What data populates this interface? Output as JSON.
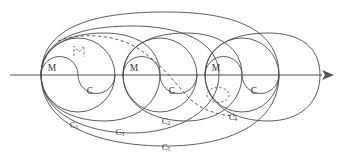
{
  "figure": {
    "background_color": "#ffffff",
    "stroke_color": "#4a4a4a",
    "axis_color": "#555555",
    "label_color": "#333333",
    "width": 338,
    "height": 166
  },
  "axis": {
    "name": "horizontal-axis",
    "x_start": 10,
    "x_end": 326,
    "y": 75,
    "has_arrow": true,
    "arrow_side": "right"
  },
  "cells": [
    {
      "index": 1,
      "center_x": 78,
      "upper_label": "M",
      "lower_label": "C",
      "upper_label_x": 52,
      "upper_label_y": 69,
      "lower_label_x": 90,
      "lower_label_y": 92,
      "radius": 37
    },
    {
      "index": 2,
      "center_x": 160,
      "upper_label": "M",
      "lower_label": "C",
      "upper_label_x": 134,
      "upper_label_y": 69,
      "lower_label_x": 172,
      "lower_label_y": 92,
      "radius": 37
    },
    {
      "index": 3,
      "center_x": 242,
      "upper_label": "M",
      "lower_label": "C",
      "upper_label_x": 216,
      "upper_label_y": 69,
      "lower_label_x": 254,
      "lower_label_y": 92,
      "radius": 37
    }
  ],
  "curve_labels": [
    {
      "name": "curve-label-c1",
      "base": "C",
      "sub": "1",
      "x": 74,
      "y": 126
    },
    {
      "name": "curve-label-c2",
      "base": "C",
      "sub": "2",
      "x": 166,
      "y": 122
    },
    {
      "name": "curve-label-c3",
      "base": "C",
      "sub": "3",
      "x": 120,
      "y": 133
    },
    {
      "name": "curve-label-c4",
      "base": "C",
      "sub": "4",
      "x": 233,
      "y": 118
    },
    {
      "name": "curve-label-c5",
      "base": "C",
      "sub": "5",
      "x": 166,
      "y": 148
    }
  ],
  "dashed_elements": [
    {
      "name": "dashed-long-curve",
      "description": "long dashed curve sweeping from upper-left over cell one down to lower-right of cell three"
    },
    {
      "name": "dashed-marker-upper-left",
      "description": "small dashed marker inside first cell upper region"
    },
    {
      "name": "dashed-marker-lower-right",
      "description": "small dashed oval inside third cell lower region"
    }
  ]
}
